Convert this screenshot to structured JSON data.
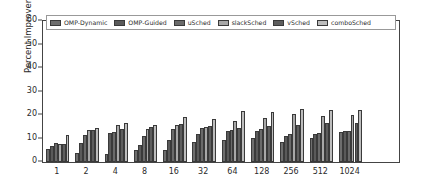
{
  "chart_data": {
    "type": "bar",
    "title": "",
    "xlabel": "Nodes",
    "ylabel": "Percent Improvement",
    "categories": [
      "1",
      "2",
      "4",
      "8",
      "16",
      "32",
      "64",
      "128",
      "256",
      "512",
      "1024"
    ],
    "ylim": [
      0,
      60
    ],
    "yticks": [
      0,
      10,
      20,
      30,
      40,
      50,
      60
    ],
    "grid": false,
    "legend_position": "upper left",
    "series": [
      {
        "name": "OMP-Dynamic",
        "color": "#6e6e6e",
        "values": [
          5.6,
          3.8,
          3.5,
          5.1,
          5.3,
          8.5,
          9.3,
          10.3,
          8.4,
          10.1,
          12.8
        ]
      },
      {
        "name": "OMP-Guided",
        "color": "#5a5a5a",
        "values": [
          6.8,
          8.3,
          12.2,
          7.1,
          9.4,
          11.8,
          13.0,
          13.3,
          11.2,
          11.9,
          13.2
        ]
      },
      {
        "name": "uSched",
        "color": "#6a6a6a",
        "values": [
          7.9,
          11.7,
          12.8,
          11.2,
          14.0,
          14.3,
          13.5,
          14.0,
          12.1,
          12.2,
          13.1
        ]
      },
      {
        "name": "slackSched",
        "color": "#a8a8a8",
        "values": [
          7.5,
          13.6,
          15.8,
          14.0,
          15.6,
          15.0,
          17.6,
          18.7,
          20.4,
          19.5,
          20.0
        ]
      },
      {
        "name": "vSched",
        "color": "#5e5e5e",
        "values": [
          7.6,
          13.8,
          14.2,
          14.7,
          16.0,
          15.4,
          14.4,
          15.2,
          15.6,
          16.7,
          16.4
        ]
      },
      {
        "name": "comboSched",
        "color": "#bdbdbd",
        "values": [
          11.6,
          14.3,
          16.8,
          15.7,
          19.1,
          18.4,
          21.5,
          21.4,
          22.7,
          22.2,
          22.3
        ]
      }
    ]
  },
  "axes": {
    "ylabel": "Percent Improvement",
    "xlabel": "Nodes"
  }
}
